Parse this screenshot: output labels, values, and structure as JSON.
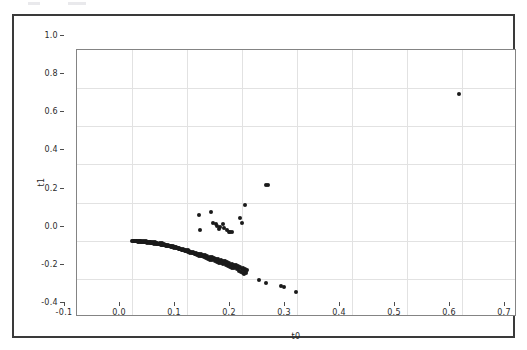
{
  "figure": {
    "background_color": "#ffffff",
    "frame_color": "#3a3a3a",
    "axes_color": "#848484",
    "grid_color": "#e2e2e2",
    "marker_color": "#1a1a1a"
  },
  "chart_data": {
    "type": "scatter",
    "title": "",
    "xlabel": "t0",
    "ylabel": "t1",
    "xlim": [
      -0.1,
      0.7
    ],
    "ylim": [
      -0.4,
      1.0
    ],
    "xticks": [
      -0.1,
      0.0,
      0.1,
      0.2,
      0.3,
      0.4,
      0.5,
      0.6,
      0.7
    ],
    "xticklabels": [
      "-0.1",
      "0.0",
      "0.1",
      "0.2",
      "0.3",
      "0.4",
      "0.5",
      "0.6",
      "0.7"
    ],
    "yticks": [
      -0.4,
      -0.2,
      0.0,
      0.2,
      0.4,
      0.6,
      0.8,
      1.0
    ],
    "yticklabels": [
      "-0.4",
      "-0.2",
      "0.0",
      "0.2",
      "0.4",
      "0.6",
      "0.8",
      "1.0"
    ],
    "grid": true,
    "legend": null,
    "marker": "o",
    "marker_size": 4,
    "series": [
      {
        "name": "samples",
        "color": "#1a1a1a",
        "points": [
          [
            0.0,
            0.0
          ],
          [
            0.002,
            -0.001
          ],
          [
            0.004,
            -0.002
          ],
          [
            0.005,
            0.0
          ],
          [
            0.007,
            -0.003
          ],
          [
            0.008,
            -0.001
          ],
          [
            0.01,
            -0.004
          ],
          [
            0.011,
            -0.002
          ],
          [
            0.013,
            -0.005
          ],
          [
            0.014,
            -0.003
          ],
          [
            0.016,
            -0.006
          ],
          [
            0.017,
            -0.004
          ],
          [
            0.019,
            -0.007
          ],
          [
            0.02,
            -0.005
          ],
          [
            0.022,
            -0.008
          ],
          [
            0.023,
            -0.006
          ],
          [
            0.025,
            -0.009
          ],
          [
            0.026,
            -0.007
          ],
          [
            0.028,
            -0.01
          ],
          [
            0.029,
            -0.008
          ],
          [
            0.031,
            -0.012
          ],
          [
            0.032,
            -0.009
          ],
          [
            0.034,
            -0.013
          ],
          [
            0.035,
            -0.01
          ],
          [
            0.037,
            -0.014
          ],
          [
            0.038,
            -0.012
          ],
          [
            0.04,
            -0.015
          ],
          [
            0.041,
            -0.013
          ],
          [
            0.043,
            -0.017
          ],
          [
            0.044,
            -0.014
          ],
          [
            0.046,
            -0.018
          ],
          [
            0.047,
            -0.016
          ],
          [
            0.049,
            -0.019
          ],
          [
            0.05,
            -0.017
          ],
          [
            0.052,
            -0.021
          ],
          [
            0.053,
            -0.018
          ],
          [
            0.055,
            -0.022
          ],
          [
            0.056,
            -0.02
          ],
          [
            0.058,
            -0.024
          ],
          [
            0.059,
            -0.021
          ],
          [
            0.061,
            -0.026
          ],
          [
            0.062,
            -0.023
          ],
          [
            0.064,
            -0.028
          ],
          [
            0.065,
            -0.025
          ],
          [
            0.067,
            -0.03
          ],
          [
            0.068,
            -0.027
          ],
          [
            0.07,
            -0.032
          ],
          [
            0.071,
            -0.029
          ],
          [
            0.073,
            -0.034
          ],
          [
            0.074,
            -0.031
          ],
          [
            0.076,
            -0.036
          ],
          [
            0.077,
            -0.033
          ],
          [
            0.079,
            -0.038
          ],
          [
            0.08,
            -0.035
          ],
          [
            0.082,
            -0.04
          ],
          [
            0.083,
            -0.037
          ],
          [
            0.085,
            -0.043
          ],
          [
            0.086,
            -0.039
          ],
          [
            0.088,
            -0.045
          ],
          [
            0.089,
            -0.042
          ],
          [
            0.091,
            -0.047
          ],
          [
            0.092,
            -0.044
          ],
          [
            0.094,
            -0.05
          ],
          [
            0.095,
            -0.046
          ],
          [
            0.097,
            -0.052
          ],
          [
            0.098,
            -0.049
          ],
          [
            0.1,
            -0.055
          ],
          [
            0.101,
            -0.051
          ],
          [
            0.103,
            -0.058
          ],
          [
            0.104,
            -0.054
          ],
          [
            0.106,
            -0.06
          ],
          [
            0.107,
            -0.057
          ],
          [
            0.109,
            -0.063
          ],
          [
            0.11,
            -0.059
          ],
          [
            0.112,
            -0.066
          ],
          [
            0.113,
            -0.062
          ],
          [
            0.115,
            -0.069
          ],
          [
            0.117,
            -0.065
          ],
          [
            0.119,
            -0.072
          ],
          [
            0.121,
            -0.068
          ],
          [
            0.123,
            -0.075
          ],
          [
            0.125,
            -0.071
          ],
          [
            0.127,
            -0.078
          ],
          [
            0.129,
            -0.074
          ],
          [
            0.131,
            -0.081
          ],
          [
            0.133,
            -0.077
          ],
          [
            0.135,
            -0.084
          ],
          [
            0.137,
            -0.08
          ],
          [
            0.139,
            -0.088
          ],
          [
            0.141,
            -0.083
          ],
          [
            0.143,
            -0.091
          ],
          [
            0.145,
            -0.086
          ],
          [
            0.147,
            -0.095
          ],
          [
            0.149,
            -0.09
          ],
          [
            0.151,
            -0.098
          ],
          [
            0.153,
            -0.093
          ],
          [
            0.155,
            -0.102
          ],
          [
            0.157,
            -0.097
          ],
          [
            0.159,
            -0.106
          ],
          [
            0.161,
            -0.1
          ],
          [
            0.163,
            -0.11
          ],
          [
            0.165,
            -0.104
          ],
          [
            0.167,
            -0.114
          ],
          [
            0.169,
            -0.108
          ],
          [
            0.171,
            -0.118
          ],
          [
            0.173,
            -0.112
          ],
          [
            0.175,
            -0.122
          ],
          [
            0.177,
            -0.116
          ],
          [
            0.179,
            -0.127
          ],
          [
            0.181,
            -0.12
          ],
          [
            0.183,
            -0.131
          ],
          [
            0.185,
            -0.125
          ],
          [
            0.187,
            -0.136
          ],
          [
            0.189,
            -0.129
          ],
          [
            0.191,
            -0.14
          ],
          [
            0.193,
            -0.134
          ],
          [
            0.195,
            -0.145
          ],
          [
            0.197,
            -0.138
          ],
          [
            0.199,
            -0.15
          ],
          [
            0.201,
            -0.143
          ],
          [
            0.203,
            -0.155
          ],
          [
            0.205,
            -0.148
          ],
          [
            0.207,
            -0.16
          ],
          [
            0.209,
            -0.153
          ],
          [
            0.195,
            -0.158
          ],
          [
            0.198,
            -0.165
          ],
          [
            0.201,
            -0.17
          ],
          [
            0.204,
            -0.175
          ],
          [
            0.207,
            -0.168
          ],
          [
            0.19,
            -0.15
          ],
          [
            0.186,
            -0.145
          ],
          [
            0.182,
            -0.141
          ],
          [
            0.178,
            -0.137
          ],
          [
            0.174,
            -0.132
          ],
          [
            0.17,
            -0.128
          ],
          [
            0.166,
            -0.124
          ],
          [
            0.162,
            -0.119
          ],
          [
            0.158,
            -0.115
          ],
          [
            0.154,
            -0.111
          ],
          [
            0.15,
            -0.107
          ],
          [
            0.146,
            -0.103
          ],
          [
            0.142,
            -0.099
          ],
          [
            0.138,
            -0.094
          ],
          [
            0.134,
            -0.09
          ],
          [
            0.13,
            -0.086
          ],
          [
            0.126,
            -0.082
          ],
          [
            0.122,
            -0.078
          ],
          [
            0.118,
            -0.074
          ],
          [
            0.114,
            -0.07
          ],
          [
            0.11,
            -0.066
          ],
          [
            0.106,
            -0.062
          ],
          [
            0.102,
            -0.058
          ],
          [
            0.098,
            -0.054
          ],
          [
            0.094,
            -0.05
          ],
          [
            0.09,
            -0.046
          ],
          [
            0.086,
            -0.042
          ],
          [
            0.082,
            -0.038
          ],
          [
            0.078,
            -0.034
          ],
          [
            0.074,
            -0.03
          ],
          [
            0.07,
            -0.026
          ],
          [
            0.066,
            -0.023
          ],
          [
            0.062,
            -0.02
          ],
          [
            0.058,
            -0.017
          ],
          [
            0.054,
            -0.014
          ],
          [
            0.05,
            -0.012
          ],
          [
            0.046,
            -0.01
          ],
          [
            0.042,
            -0.008
          ],
          [
            0.038,
            -0.006
          ],
          [
            0.034,
            -0.005
          ],
          [
            0.03,
            -0.004
          ],
          [
            0.026,
            -0.003
          ],
          [
            0.022,
            -0.002
          ],
          [
            0.018,
            -0.001
          ],
          [
            0.014,
            -0.001
          ],
          [
            0.01,
            0.0
          ],
          [
            0.006,
            0.0
          ],
          [
            0.23,
            -0.208
          ],
          [
            0.243,
            -0.221
          ],
          [
            0.271,
            -0.237
          ],
          [
            0.277,
            -0.24
          ],
          [
            0.298,
            -0.268
          ],
          [
            0.122,
            0.136
          ],
          [
            0.124,
            0.058
          ],
          [
            0.144,
            0.15
          ],
          [
            0.148,
            0.092
          ],
          [
            0.152,
            0.086
          ],
          [
            0.155,
            0.078
          ],
          [
            0.158,
            0.06
          ],
          [
            0.16,
            0.074
          ],
          [
            0.165,
            0.09
          ],
          [
            0.168,
            0.068
          ],
          [
            0.172,
            0.058
          ],
          [
            0.176,
            0.046
          ],
          [
            0.178,
            0.044
          ],
          [
            0.182,
            0.044
          ],
          [
            0.196,
            0.118
          ],
          [
            0.199,
            0.094
          ],
          [
            0.206,
            0.188
          ],
          [
            0.243,
            0.292
          ],
          [
            0.248,
            0.294
          ],
          [
            0.595,
            0.77
          ]
        ]
      }
    ]
  }
}
